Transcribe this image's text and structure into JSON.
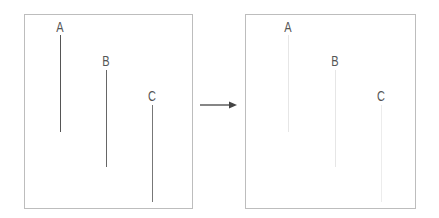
{
  "left_panel": {
    "lines": [
      {
        "label": "A",
        "x": 60,
        "label_y": 22,
        "y1": 35,
        "y2": 132,
        "color": "#555555"
      },
      {
        "label": "B",
        "x": 106,
        "label_y": 56,
        "y1": 70,
        "y2": 167,
        "color": "#666666"
      },
      {
        "label": "C",
        "x": 152,
        "label_y": 91,
        "y1": 105,
        "y2": 202,
        "color": "#777777"
      }
    ]
  },
  "right_panel": {
    "lines": [
      {
        "label": "A",
        "x": 288,
        "label_y": 22,
        "y1": 35,
        "y2": 132,
        "color": "#e6e6e6"
      },
      {
        "label": "B",
        "x": 335,
        "label_y": 56,
        "y1": 70,
        "y2": 167,
        "color": "#e6e6e6"
      },
      {
        "label": "C",
        "x": 381,
        "label_y": 91,
        "y1": 105,
        "y2": 202,
        "color": "#ececec"
      }
    ]
  },
  "arrow": {
    "direction": "right",
    "color": "#444444"
  }
}
